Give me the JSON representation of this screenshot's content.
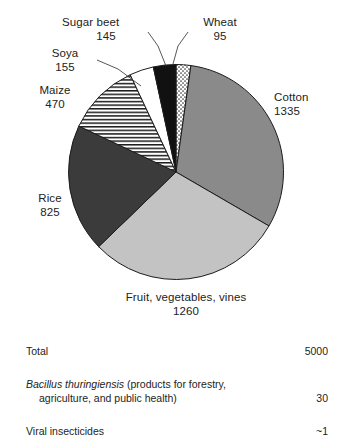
{
  "chart_data": {
    "type": "pie",
    "title": "",
    "unit": "",
    "legend": "labels-outside",
    "grid": false,
    "total_label": "Total",
    "total_value": 5000,
    "start_angle_deg": 0,
    "direction": "clockwise",
    "categories": [
      "Wheat",
      "Cotton",
      "Fruit, vegetables, vines",
      "Rice",
      "Maize",
      "Soya",
      "Sugar beet"
    ],
    "values": [
      95,
      1335,
      1260,
      825,
      470,
      155,
      145
    ],
    "slices": [
      {
        "name": "Wheat",
        "value": 95,
        "fill": "stipple",
        "color": "#ffffff"
      },
      {
        "name": "Cotton",
        "value": 1335,
        "fill": "solid",
        "color": "#8a8a8a"
      },
      {
        "name": "Fruit, vegetables, vines",
        "value": 1260,
        "fill": "solid",
        "color": "#c3c3c3"
      },
      {
        "name": "Rice",
        "value": 825,
        "fill": "solid",
        "color": "#3b3b3b"
      },
      {
        "name": "Maize",
        "value": 470,
        "fill": "horizontal-lines",
        "color": "#ffffff"
      },
      {
        "name": "Soya",
        "value": 155,
        "fill": "solid",
        "color": "#ffffff"
      },
      {
        "name": "Sugar beet",
        "value": 145,
        "fill": "solid",
        "color": "#111111"
      }
    ]
  },
  "labels": {
    "sugar_beet": {
      "name": "Sugar beet",
      "value": "145"
    },
    "wheat": {
      "name": "Wheat",
      "value": "95"
    },
    "soya": {
      "name": "Soya",
      "value": "155"
    },
    "maize": {
      "name": "Maize",
      "value": "470"
    },
    "rice": {
      "name": "Rice",
      "value": "825"
    },
    "cotton": {
      "name": "Cotton",
      "value": "1335"
    },
    "fruit": {
      "name": "Fruit, vegetables, vines",
      "value": "1260"
    }
  },
  "table": {
    "rows": [
      {
        "name": "Total",
        "value": "5000"
      },
      {
        "name_italic": "Bacillus thuringiensis",
        "name_rest": " (products for forestry,",
        "name_line2": "agriculture, and public health)",
        "value": "30"
      },
      {
        "name": "Viral insecticides",
        "value": "~1"
      }
    ]
  }
}
